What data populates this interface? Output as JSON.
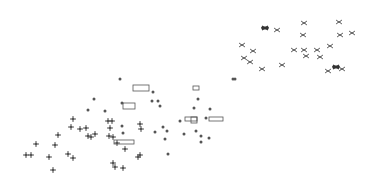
{
  "background": "#ffffff",
  "ink": "#555555",
  "ink_dark": "#333333",
  "markers": {
    "bowtie": [
      [
        265,
        28,
        1
      ],
      [
        277,
        30,
        0
      ],
      [
        304,
        23,
        0
      ],
      [
        339,
        22,
        0
      ],
      [
        303,
        35,
        0
      ],
      [
        340,
        35,
        0
      ],
      [
        352,
        33,
        0
      ],
      [
        242,
        45,
        0
      ],
      [
        253,
        51,
        0
      ],
      [
        294,
        50,
        0
      ],
      [
        304,
        50,
        0
      ],
      [
        306,
        56,
        0
      ],
      [
        317,
        50,
        0
      ],
      [
        320,
        57,
        0
      ],
      [
        330,
        46,
        0
      ],
      [
        244,
        58,
        0
      ],
      [
        250,
        62,
        0
      ],
      [
        262,
        69,
        0
      ],
      [
        282,
        65,
        0
      ],
      [
        328,
        71,
        0
      ],
      [
        336,
        67,
        1
      ],
      [
        342,
        69,
        0
      ]
    ],
    "cross": [
      [
        73,
        119
      ],
      [
        71,
        127
      ],
      [
        80,
        129
      ],
      [
        86,
        128
      ],
      [
        58,
        135
      ],
      [
        36,
        144
      ],
      [
        55,
        145
      ],
      [
        31,
        155
      ],
      [
        68,
        154
      ],
      [
        73,
        158
      ],
      [
        49,
        157
      ],
      [
        26,
        155
      ],
      [
        53,
        170
      ],
      [
        108,
        121
      ],
      [
        112,
        121
      ],
      [
        110,
        128
      ],
      [
        140,
        124
      ],
      [
        141,
        129
      ],
      [
        109,
        136
      ],
      [
        113,
        137
      ],
      [
        117,
        143
      ],
      [
        125,
        149
      ],
      [
        138,
        157
      ],
      [
        140,
        155
      ],
      [
        113,
        163
      ],
      [
        115,
        167
      ],
      [
        123,
        168
      ],
      [
        95,
        134
      ],
      [
        91,
        137
      ],
      [
        88,
        136
      ]
    ],
    "dot": [
      [
        94,
        99
      ],
      [
        88,
        110
      ],
      [
        105,
        111
      ],
      [
        122,
        103
      ],
      [
        153,
        92
      ],
      [
        152,
        101
      ],
      [
        158,
        101
      ],
      [
        160,
        106
      ],
      [
        122,
        126
      ],
      [
        123,
        133
      ],
      [
        155,
        132
      ],
      [
        163,
        127
      ],
      [
        167,
        131
      ],
      [
        165,
        139
      ],
      [
        184,
        134
      ],
      [
        196,
        131
      ],
      [
        201,
        136
      ],
      [
        194,
        108
      ],
      [
        206,
        118
      ],
      [
        201,
        142
      ],
      [
        168,
        154
      ],
      [
        209,
        138
      ],
      [
        180,
        121
      ],
      [
        120,
        79
      ],
      [
        233,
        79
      ],
      [
        198,
        99
      ],
      [
        210,
        109
      ],
      [
        235,
        79
      ]
    ],
    "rect": [
      [
        133,
        85,
        16,
        6
      ],
      [
        123,
        103,
        12,
        6
      ],
      [
        193,
        86,
        6,
        4
      ],
      [
        185,
        117,
        12,
        4
      ],
      [
        209,
        117,
        14,
        4
      ],
      [
        114,
        140,
        20,
        4
      ],
      [
        191,
        117,
        6,
        6
      ]
    ]
  }
}
